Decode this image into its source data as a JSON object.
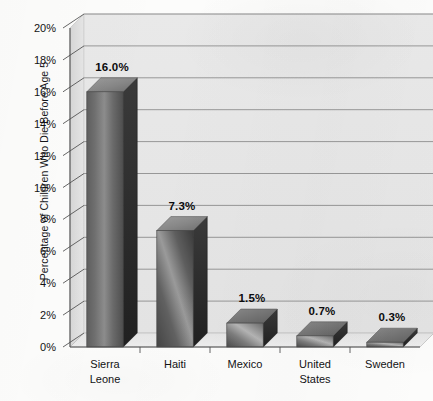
{
  "chart_data": {
    "type": "bar",
    "title": "",
    "subtitle": "",
    "xlabel": "",
    "ylabel": "Percentage of Children Who Die Before Age 5",
    "ylim": [
      0,
      20
    ],
    "ytick_step": 2,
    "ytick_labels": [
      "0%",
      "2%",
      "4%",
      "6%",
      "8%",
      "10%",
      "12%",
      "14%",
      "16%",
      "18%",
      "20%"
    ],
    "ytick_values": [
      0,
      2,
      4,
      6,
      8,
      10,
      12,
      14,
      16,
      18,
      20
    ],
    "categories": [
      "Sierra\nLeone",
      "Haiti",
      "Mexico",
      "United\nStates",
      "Sweden"
    ],
    "category_names": [
      "Sierra Leone",
      "Haiti",
      "Mexico",
      "United States",
      "Sweden"
    ],
    "values": [
      16.0,
      7.3,
      1.5,
      0.7,
      0.3
    ],
    "data_labels": [
      "16.0%",
      "7.3%",
      "1.5%",
      "0.7%",
      "0.3%"
    ],
    "grid": true,
    "grid_axis": "y",
    "legend": false,
    "legend_position": "none",
    "style": "3d-bar",
    "colors": {
      "bar_front_light": "#b9b9b9",
      "bar_front_dark": "#4c4c4c",
      "bar_top": "#8e8e8e",
      "bar_side": "#2b2b2b",
      "plot_background": "#e7e7e7",
      "wall_side": "#dcdcdc",
      "floor": "#e2e2e2",
      "gridline": "#8d8d8d",
      "axis": "#555555",
      "page_background": "#fcfcfb",
      "text": "#121214"
    }
  },
  "axis_geometry": {
    "note": "3D skewed plot; values used by the template for positioning only",
    "x_left": 70,
    "x_right": 420,
    "y_top_value": 20,
    "y_zero_px": 347,
    "y_top_px": 28,
    "depth_x": 14,
    "depth_y": -14
  }
}
